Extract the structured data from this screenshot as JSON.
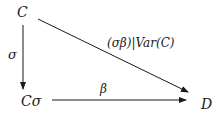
{
  "diagram": {
    "nodes": {
      "C": "C",
      "Csigma": "Cσ",
      "D": "D"
    },
    "edges": {
      "sigma": {
        "from": "C",
        "to": "Cσ",
        "label": "σ"
      },
      "beta": {
        "from": "Cσ",
        "to": "D",
        "label": "β"
      },
      "composite": {
        "from": "C",
        "to": "D",
        "label": "(σβ)|Var(C)"
      }
    },
    "colors": {
      "stroke": "#1a1a1a",
      "background": "#ffffff"
    }
  }
}
